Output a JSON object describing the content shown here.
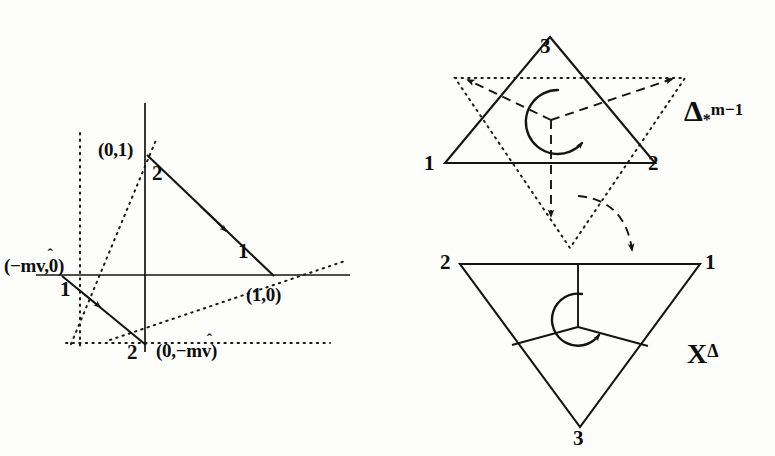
{
  "figure": {
    "background_color": "#fdfdfb",
    "ink_color": "#141414"
  },
  "left_plot": {
    "name": "coordinate-simplex-plot",
    "axes": {
      "x_axis_label": "",
      "y_axis_label": "",
      "origin_px": [
        145,
        275
      ]
    },
    "points": [
      {
        "id": "p-0-1",
        "label": "(0,1)",
        "x_px": 147,
        "y_px": 155
      },
      {
        "id": "p-1-0",
        "label": "(1,0)",
        "x_px": 272,
        "y_px": 275
      },
      {
        "id": "p-neg-mv-0",
        "label": "(-m̂v,0)",
        "label_plain": "(−m̂v,0)",
        "x_px": 62,
        "y_px": 275
      },
      {
        "id": "p-0-neg-mv",
        "label": "(0,-m̂v)",
        "label_plain": "(0,−m̂v)",
        "x_px": 145,
        "y_px": 352
      }
    ],
    "edge_labels": [
      {
        "id": "edge-2-upper",
        "text": "2",
        "x_px": 158,
        "y_px": 172
      },
      {
        "id": "edge-1-upper",
        "text": "1",
        "x_px": 243,
        "y_px": 248
      },
      {
        "id": "edge-1-lower",
        "text": "1",
        "x_px": 66,
        "y_px": 284
      },
      {
        "id": "edge-2-lower",
        "text": "2",
        "x_px": 133,
        "y_px": 352
      }
    ],
    "coordinate_texts": {
      "zero_one": "(0,1)",
      "one_zero": "(1,0)",
      "neg_mv_zero_open": "(−m",
      "neg_mv_zero_close": "v,0)",
      "zero_neg_mv_open": "(0,−m",
      "zero_neg_mv_close": "v)",
      "hat": "ˆ"
    }
  },
  "top_right_diagram": {
    "name": "star-simplex-diagram",
    "symbol": {
      "base": "Δ",
      "superscript": "m−1",
      "subscript": "*",
      "full": "Δ*^(m−1)"
    },
    "vertices": [
      {
        "label": "1",
        "x_px": 430,
        "y_px": 165
      },
      {
        "label": "2",
        "x_px": 652,
        "y_px": 165
      },
      {
        "label": "3",
        "x_px": 545,
        "y_px": 36
      }
    ]
  },
  "bottom_right_diagram": {
    "name": "dual-cell-diagram",
    "symbol": {
      "base": "X",
      "superscript": "Δ",
      "full": "X^Δ"
    },
    "vertices": [
      {
        "label": "2",
        "x_px": 447,
        "y_px": 263
      },
      {
        "label": "1",
        "x_px": 712,
        "y_px": 263
      },
      {
        "label": "3",
        "x_px": 580,
        "y_px": 430
      }
    ]
  },
  "transition_arrow": {
    "name": "curved-dashed-transition-arrow",
    "from": "star-simplex-diagram",
    "to": "dual-cell-diagram"
  }
}
